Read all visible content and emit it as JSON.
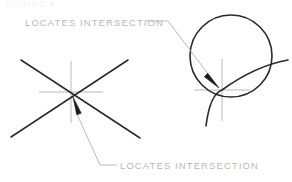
{
  "figure": {
    "header_fragment": "FIGURE 4",
    "background_color": "#ffffff",
    "line_color": "#2a2a2a",
    "crosshair_color": "#b9b9b9",
    "leader_color": "#b9b9b9",
    "text_color": "#b9b9b9",
    "width": 292,
    "height": 182
  },
  "labels": {
    "top": "LOCATES  INTERSECTION",
    "bottom": "LOCATES  INTERSECTION"
  },
  "diagrams": {
    "left": {
      "name": "two-crossing-lines",
      "line_a": {
        "x1": 11,
        "y1": 137,
        "x2": 128,
        "y2": 60
      },
      "line_b": {
        "x1": 21,
        "y1": 60,
        "x2": 140,
        "y2": 138
      },
      "crosshair": {
        "cx": 71,
        "cy": 92,
        "half_width": 32,
        "half_height": 31
      },
      "intersection": {
        "x": 71,
        "y": 92
      },
      "arrow": {
        "tip_x": 73,
        "tip_y": 97,
        "tail_x": 79,
        "tail_y": 114
      }
    },
    "right": {
      "name": "circle-and-arc",
      "circle": {
        "cx": 231,
        "cy": 56,
        "r": 41
      },
      "arc_start": {
        "x": 206,
        "y": 126
      },
      "arc_end": {
        "x": 288,
        "y": 60
      },
      "crosshair": {
        "cx": 222,
        "cy": 90,
        "half_width": 28,
        "half_height": 31
      },
      "intersection": {
        "x": 222,
        "y": 90
      },
      "arrow": {
        "tip_x": 219,
        "tip_y": 88,
        "tail_x": 206,
        "tail_y": 75
      }
    }
  },
  "leaders": {
    "top": {
      "name": "top-leader-line",
      "segments": [
        {
          "x1": 146,
          "y1": 21,
          "x2": 168,
          "y2": 21
        },
        {
          "x1": 168,
          "y1": 21,
          "x2": 218,
          "y2": 87
        }
      ]
    },
    "bottom": {
      "name": "bottom-leader-line",
      "segments": [
        {
          "x1": 117,
          "y1": 165,
          "x2": 100,
          "y2": 165
        },
        {
          "x1": 100,
          "y1": 165,
          "x2": 76,
          "y2": 112
        }
      ]
    }
  }
}
